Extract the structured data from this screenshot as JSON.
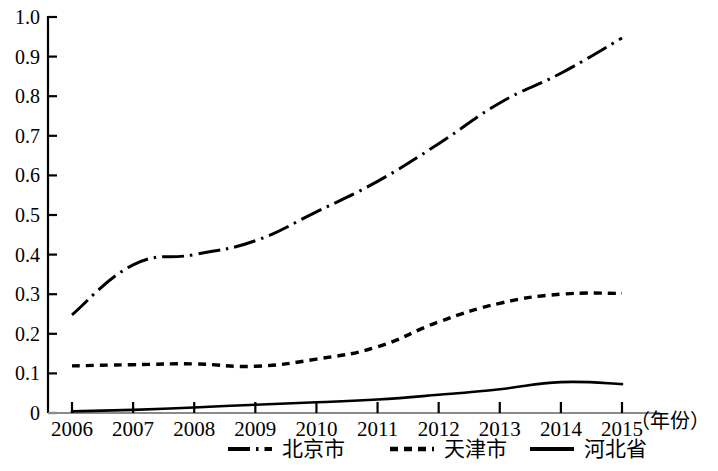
{
  "chart_data": {
    "type": "line",
    "title": "",
    "subtitle": "",
    "xlabel": "（年份）",
    "ylabel": "",
    "x": [
      2006,
      2007,
      2008,
      2009,
      2010,
      2011,
      2012,
      2013,
      2014,
      2015
    ],
    "categories": [
      "2006",
      "2007",
      "2008",
      "2009",
      "2010",
      "2011",
      "2012",
      "2013",
      "2014",
      "2015"
    ],
    "xlim": [
      2006,
      2015
    ],
    "ylim": [
      0,
      1.0
    ],
    "y_ticks": [
      0,
      0.1,
      0.2,
      0.3,
      0.4,
      0.5,
      0.6,
      0.7,
      0.8,
      0.9,
      1.0
    ],
    "y_tick_labels": [
      "0",
      "0.1",
      "0.2",
      "0.3",
      "0.4",
      "0.5",
      "0.6",
      "0.7",
      "0.8",
      "0.9",
      "1.0"
    ],
    "grid": false,
    "legend_position": "bottom",
    "series": [
      {
        "name": "北京市",
        "style": "dash-dot",
        "color": "#000000",
        "values": [
          0.248,
          0.374,
          0.4,
          0.435,
          0.508,
          0.585,
          0.68,
          0.783,
          0.858,
          0.947
        ]
      },
      {
        "name": "天津市",
        "style": "dotted",
        "color": "#000000",
        "values": [
          0.119,
          0.122,
          0.124,
          0.118,
          0.136,
          0.167,
          0.23,
          0.277,
          0.3,
          0.302
        ]
      },
      {
        "name": "河北省",
        "style": "solid",
        "color": "#000000",
        "values": [
          0.004,
          0.008,
          0.014,
          0.021,
          0.027,
          0.034,
          0.046,
          0.06,
          0.078,
          0.073
        ]
      }
    ]
  },
  "axes": {
    "y_tick_labels": [
      "1.0",
      "0.9",
      "0.8",
      "0.7",
      "0.6",
      "0.5",
      "0.4",
      "0.3",
      "0.2",
      "0.1",
      "0"
    ],
    "x_tick_labels": [
      "2006",
      "2007",
      "2008",
      "2009",
      "2010",
      "2011",
      "2012",
      "2013",
      "2014",
      "2015"
    ],
    "x_axis_name": "（年份）"
  },
  "legend": {
    "items": [
      {
        "label": "北京市",
        "style": "dash-dot"
      },
      {
        "label": "天津市",
        "style": "dotted"
      },
      {
        "label": "河北省",
        "style": "solid"
      }
    ]
  }
}
